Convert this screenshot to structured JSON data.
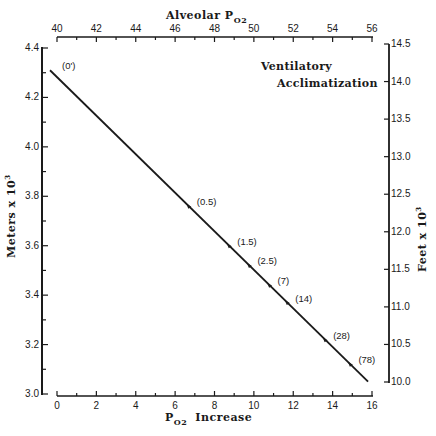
{
  "chart_data": {
    "type": "line",
    "title": "",
    "annotation": [
      "Ventilatory",
      "Acclimatization"
    ],
    "xlabel": "PO2 Increase",
    "xlabel_main": "P",
    "xlabel_sub": "O2",
    "xlabel_rest": "Increase",
    "x2label_main": "Alveolar  P",
    "x2label_sub": "O2",
    "ylabel": "Meters x 10^3",
    "ylabel_text": "Meters  x  10",
    "ylabel_sup": "3",
    "y2label": "Feet x 10^3",
    "y2label_text": "Feet  x  10",
    "y2label_sup": "3",
    "xlim": [
      0,
      16
    ],
    "x2lim": [
      40,
      56
    ],
    "ylim": [
      3.0,
      4.4
    ],
    "y2lim": [
      10.0,
      14.5
    ],
    "x_ticks": [
      "0",
      "2",
      "4",
      "6",
      "8",
      "10",
      "12",
      "14",
      "16"
    ],
    "x2_ticks": [
      "40",
      "42",
      "44",
      "46",
      "48",
      "50",
      "52",
      "54",
      "56"
    ],
    "y_ticks": [
      "3.0",
      "3.2",
      "3.4",
      "3.6",
      "3.8",
      "4.0",
      "4.2",
      "4.4"
    ],
    "y2_ticks": [
      "10.0",
      "10.5",
      "11.0",
      "11.5",
      "12.0",
      "12.5",
      "13.0",
      "13.5",
      "14.0",
      "14.5"
    ],
    "grid": false,
    "series": [
      {
        "name": "Ventilatory Acclimatization",
        "line": {
          "x": [
            -0.5,
            15.8
          ],
          "y": [
            4.31,
            3.05
          ]
        },
        "points": [
          {
            "label": "(0')",
            "x": 0.0,
            "y": 4.31
          },
          {
            "label": "(0.5)",
            "x": 7.0,
            "y": 3.76
          },
          {
            "label": "(1.5)",
            "x": 8.9,
            "y": 3.6
          },
          {
            "label": "(2.5)",
            "x": 9.8,
            "y": 3.52
          },
          {
            "label": "(7)",
            "x": 10.6,
            "y": 3.44
          },
          {
            "label": "(14)",
            "x": 11.6,
            "y": 3.37
          },
          {
            "label": "(28)",
            "x": 13.4,
            "y": 3.22
          },
          {
            "label": "(78)",
            "x": 14.7,
            "y": 3.12
          }
        ]
      }
    ]
  }
}
